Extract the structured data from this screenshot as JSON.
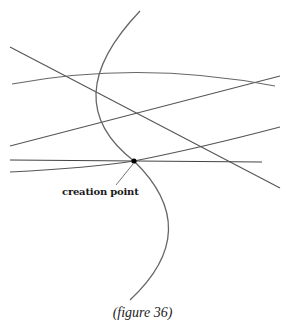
{
  "figure": {
    "caption": "(figure 36)",
    "point_label": "creation point"
  },
  "colors": {
    "background": "#ffffff",
    "line": "#555555",
    "point": "#000000",
    "text": "#1a1a1a"
  },
  "geometry": {
    "creation_point": {
      "x": 134,
      "y": 161
    },
    "straight_lines": [
      {
        "id": "diagonal-descending",
        "x1": 10,
        "y1": 47,
        "x2": 280,
        "y2": 188
      },
      {
        "id": "rising-upper",
        "x1": 10,
        "y1": 146,
        "x2": 280,
        "y2": 76
      },
      {
        "id": "horizontal",
        "x1": 10,
        "y1": 160,
        "x2": 262,
        "y2": 162
      }
    ],
    "curves": [
      {
        "id": "vertical-arc",
        "d": "M 140 11 Q 55 100 134 161 Q 205 230 130 300"
      },
      {
        "id": "upper-shallow-arc",
        "d": "M 12 84 Q 140 60 275 86"
      },
      {
        "id": "lower-rising-arc",
        "d": "M 10 172 Q 90 168 134 161 Q 200 148 280 127"
      }
    ],
    "leader_line": {
      "x1": 133,
      "y1": 164,
      "x2": 116,
      "y2": 185
    }
  }
}
